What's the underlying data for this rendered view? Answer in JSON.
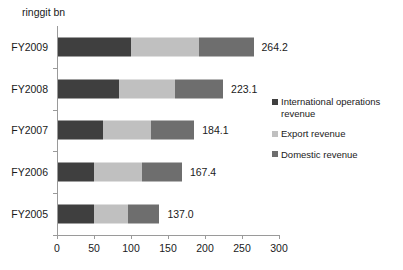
{
  "chart_data": {
    "type": "bar",
    "orientation": "horizontal",
    "stacked": true,
    "title": "",
    "axis_title": "ringgit bn",
    "xlabel": "",
    "ylabel": "",
    "xlim": [
      0,
      300
    ],
    "xticks": [
      0,
      50,
      100,
      150,
      200,
      250,
      300
    ],
    "xtick_labels": [
      "0",
      "50",
      "100",
      "150",
      "200",
      "250",
      "300"
    ],
    "grid": false,
    "legend_position": "right",
    "categories": [
      "FY2009",
      "FY2008",
      "FY2007",
      "FY2006",
      "FY2005"
    ],
    "series": [
      {
        "name": "International operations revenue",
        "color": "#3f3f3f",
        "values": [
          98.0,
          82.0,
          61.0,
          49.0,
          48.0
        ]
      },
      {
        "name": "Export revenue",
        "color": "#c0c0c0",
        "values": [
          92.0,
          76.0,
          65.0,
          65.0,
          47.0
        ]
      },
      {
        "name": "Domestic revenue",
        "color": "#6e6e6e",
        "values": [
          74.2,
          65.1,
          58.1,
          53.4,
          42.0
        ]
      }
    ],
    "totals": [
      264.2,
      223.1,
      184.1,
      167.4,
      137.0
    ],
    "total_labels": [
      "264.2",
      "223.1",
      "184.1",
      "167.4",
      "137.0"
    ]
  },
  "legend": {
    "items": [
      {
        "label": "International operations revenue",
        "color": "#3f3f3f"
      },
      {
        "label": "Export revenue",
        "color": "#c0c0c0"
      },
      {
        "label": "Domestic revenue",
        "color": "#6e6e6e"
      }
    ]
  },
  "colors": {
    "international": "#3f3f3f",
    "export": "#c0c0c0",
    "domestic": "#6e6e6e",
    "axis": "#9a9a9a",
    "text": "#1a1a1a",
    "background": "#ffffff"
  }
}
